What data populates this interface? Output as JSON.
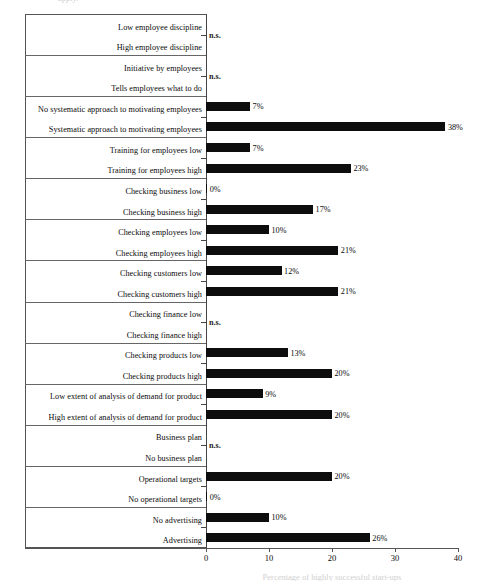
{
  "figure": {
    "top_artifact_text": "apply.",
    "xaxis_title": "Percentage of highly successful start-ups"
  },
  "chart_data": {
    "type": "bar",
    "orientation": "horizontal",
    "title": "",
    "xlabel": "Percentage of highly successful start-ups",
    "ylabel": "",
    "xlim": [
      0,
      40
    ],
    "xticks": [
      0,
      10,
      20,
      30,
      40
    ],
    "xtick_labels": [
      "0",
      "10",
      "20",
      "30",
      "40"
    ],
    "grid": false,
    "legend": null,
    "value_label_suffix": "%",
    "not_significant_marker": "n.s.",
    "categories": [
      "Low employee discipline",
      "High employee discipline",
      "Initiative by employees",
      "Tells employees what to do",
      "No systematic approach to motivating employees",
      "Systematic approach to motivating employees",
      "Training for employees low",
      "Training for employees high",
      "Checking business low",
      "Checking business high",
      "Checking employees low",
      "Checking employees high",
      "Checking customers low",
      "Checking customers high",
      "Checking finance low",
      "Checking finance high",
      "Checking products low",
      "Checking products high",
      "Low extent of analysis of demand for product",
      "High extent of analysis of demand for product",
      "Business plan",
      "No business plan",
      "Operational targets",
      "No operational targets",
      "No advertising",
      "Advertising"
    ],
    "values": [
      null,
      null,
      null,
      null,
      7,
      38,
      7,
      23,
      0,
      17,
      10,
      21,
      12,
      21,
      null,
      null,
      13,
      20,
      9,
      20,
      null,
      null,
      20,
      0,
      10,
      26
    ],
    "value_labels": [
      "",
      "",
      "",
      "",
      "7%",
      "38%",
      "7%",
      "23%",
      "0%",
      "17%",
      "10%",
      "21%",
      "12%",
      "21%",
      "",
      "",
      "13%",
      "20%",
      "9%",
      "20%",
      "",
      "",
      "20%",
      "0%",
      "10%",
      "26%"
    ],
    "pair_groups": [
      {
        "labels": [
          "Low employee discipline",
          "High employee discipline"
        ],
        "significant": false,
        "note": "n.s."
      },
      {
        "labels": [
          "Initiative by employees",
          "Tells employees what to do"
        ],
        "significant": false,
        "note": "n.s."
      },
      {
        "labels": [
          "No systematic approach to motivating employees",
          "Systematic approach to motivating employees"
        ],
        "significant": true,
        "note": ""
      },
      {
        "labels": [
          "Training for employees low",
          "Training for employees high"
        ],
        "significant": true,
        "note": ""
      },
      {
        "labels": [
          "Checking business low",
          "Checking business high"
        ],
        "significant": true,
        "note": ""
      },
      {
        "labels": [
          "Checking employees low",
          "Checking employees high"
        ],
        "significant": true,
        "note": ""
      },
      {
        "labels": [
          "Checking customers low",
          "Checking customers high"
        ],
        "significant": true,
        "note": ""
      },
      {
        "labels": [
          "Checking finance low",
          "Checking finance high"
        ],
        "significant": false,
        "note": "n.s."
      },
      {
        "labels": [
          "Checking products low",
          "Checking products high"
        ],
        "significant": true,
        "note": ""
      },
      {
        "labels": [
          "Low extent of analysis of demand for product",
          "High extent of analysis of demand for product"
        ],
        "significant": true,
        "note": ""
      },
      {
        "labels": [
          "Business plan",
          "No business plan"
        ],
        "significant": false,
        "note": "n.s."
      },
      {
        "labels": [
          "Operational targets",
          "No operational targets"
        ],
        "significant": true,
        "note": ""
      },
      {
        "labels": [
          "No advertising",
          "Advertising"
        ],
        "significant": true,
        "note": ""
      }
    ],
    "colors": {
      "bar": "#0d0d0d",
      "axis": "#555555",
      "text": "#0a0a0a",
      "background": "#ffffff"
    }
  }
}
